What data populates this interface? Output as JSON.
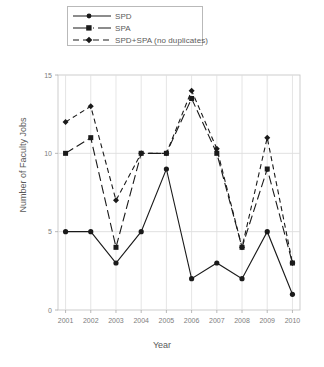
{
  "chart_data": {
    "type": "line",
    "title": "",
    "xlabel": "Year",
    "ylabel": "Number of Faculty Jobs",
    "x": [
      2001,
      2002,
      2003,
      2004,
      2005,
      2006,
      2007,
      2008,
      2009,
      2010
    ],
    "categories": [
      "2001",
      "2002",
      "2003",
      "2004",
      "2005",
      "2006",
      "2007",
      "2008",
      "2009",
      "2010"
    ],
    "xlim": [
      2000.7,
      2010.3
    ],
    "ylim": [
      0,
      15
    ],
    "yticks": [
      0,
      5,
      10,
      15
    ],
    "yticklabels": [
      "0",
      "5",
      "10",
      "15"
    ],
    "grid": true,
    "legend_position": "above-plot-left",
    "series": [
      {
        "name": "SPD",
        "marker": "filled-circle",
        "linestyle": "solid",
        "color": "#1a1a1a",
        "values": [
          5,
          5,
          3,
          5,
          9,
          2,
          3,
          2,
          5,
          1
        ]
      },
      {
        "name": "SPA",
        "marker": "filled-square",
        "linestyle": "long-dashed",
        "color": "#1a1a1a",
        "values": [
          10,
          11,
          4,
          10,
          10,
          13.5,
          10,
          4,
          9,
          3
        ]
      },
      {
        "name": "SPD+SPA (no duplicates)",
        "marker": "filled-diamond",
        "linestyle": "short-dashed",
        "color": "#1a1a1a",
        "values": [
          12,
          13,
          7,
          10,
          10,
          14,
          10.3,
          4,
          11,
          3
        ]
      }
    ]
  },
  "legend": {
    "items": [
      {
        "label": "SPD"
      },
      {
        "label": "SPA"
      },
      {
        "label": "SPD+SPA (no duplicates)"
      }
    ]
  },
  "axes": {
    "x_title": "Year",
    "y_title": "Number of Faculty Jobs"
  }
}
